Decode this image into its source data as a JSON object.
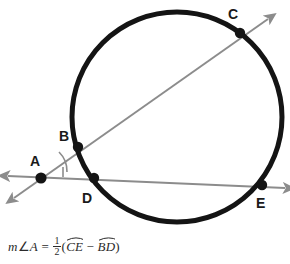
{
  "figure": {
    "shape": "circle",
    "circle": {
      "cx": 177,
      "cy": 117,
      "r": 105,
      "stroke": "#141414",
      "stroke_width": 5,
      "fill": "none"
    },
    "line_color": "#8c8c8c",
    "point_color": "#141414",
    "label_color": "#1a1a1a",
    "background": "#ffffff",
    "points": [
      {
        "id": "A",
        "label": "A",
        "x": 41,
        "y": 178,
        "label_x": 30,
        "label_y": 166,
        "role": "external-vertex"
      },
      {
        "id": "B",
        "label": "B",
        "x": 78,
        "y": 147,
        "label_x": 59,
        "label_y": 141,
        "role": "circle-intersection"
      },
      {
        "id": "C",
        "label": "C",
        "x": 240,
        "y": 33,
        "label_x": 228,
        "label_y": 19,
        "role": "circle-intersection"
      },
      {
        "id": "D",
        "label": "D",
        "x": 94,
        "y": 178,
        "label_x": 82,
        "label_y": 203,
        "role": "circle-intersection"
      },
      {
        "id": "E",
        "label": "E",
        "x": 262,
        "y": 185,
        "label_x": 256,
        "label_y": 208,
        "role": "circle-intersection"
      }
    ],
    "secants": [
      {
        "id": "secant-ABC",
        "through": "A-B-C",
        "from_x": 14,
        "from_y": 198,
        "to_x": 268,
        "to_y": 19,
        "arrow_start": true,
        "arrow_end": true
      },
      {
        "id": "secant-ADE",
        "through": "A-D-E",
        "from_x": 8,
        "from_y": 176,
        "to_x": 285,
        "to_y": 188,
        "arrow_start": true,
        "arrow_end": true
      }
    ],
    "angle_mark": {
      "at": "A",
      "radius": 26,
      "label": "angle-A-arc"
    },
    "tick_mark": {
      "near": "A",
      "label": "angle-tick"
    }
  },
  "formula": {
    "lhs_m": "m",
    "lhs_angle_symbol": "∠",
    "lhs_vertex": "A",
    "equals": "=",
    "fraction_numerator": "1",
    "fraction_denominator": "2",
    "open_paren": "(",
    "arc_one": "CE",
    "minus": "−",
    "arc_two": "BD",
    "close_paren": ")",
    "plain_text": "m∠A = 1/2(arc CE − arc BD)"
  }
}
